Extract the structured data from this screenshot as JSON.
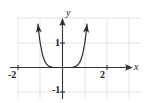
{
  "figure": {
    "title": "",
    "axis_labels": {
      "x": "x",
      "y": "y"
    },
    "tick_labels": {
      "x_neg2": "-2",
      "x_2": "2",
      "y_1": "1",
      "y_neg1": "-1"
    },
    "colors": {
      "curve": "#262626",
      "axis": "#333333",
      "grid": "#d9d9d9",
      "text": "#1a1a1a",
      "background": "#ffffff"
    }
  },
  "chart_data": {
    "type": "line",
    "title": "",
    "xlabel": "x",
    "ylabel": "y",
    "xlim": [
      -2.6,
      3.1
    ],
    "ylim": [
      -1.35,
      2.5
    ],
    "xticks": [
      -2,
      2
    ],
    "xticklabels": [
      "-2",
      "2"
    ],
    "yticks": [
      1,
      -1
    ],
    "yticklabels": [
      "1",
      "-1"
    ],
    "grid": true,
    "grid_x": [
      -2,
      -1,
      0,
      1,
      2,
      3
    ],
    "grid_y": [
      -1,
      0,
      1,
      2
    ],
    "legend": null,
    "annotations": [],
    "series": [
      {
        "name": "y = x^6",
        "equation": "y = x^6",
        "color": "#262626",
        "arrow_start": true,
        "arrow_end": true,
        "x": [
          -1.55,
          -1.5,
          -1.45,
          -1.4,
          -1.35,
          -1.3,
          -1.25,
          -1.2,
          -1.15,
          -1.1,
          -1.05,
          -1.0,
          -0.9,
          -0.8,
          -0.7,
          -0.6,
          -0.5,
          -0.4,
          -0.3,
          -0.2,
          -0.1,
          0.0,
          0.1,
          0.2,
          0.3,
          0.4,
          0.5,
          0.6,
          0.7,
          0.8,
          0.9,
          1.0,
          1.05,
          1.1,
          1.15,
          1.2,
          1.25,
          1.3,
          1.35,
          1.4,
          1.45,
          1.5,
          1.55
        ],
        "y": [
          13.84,
          11.39,
          9.29,
          7.53,
          6.05,
          4.83,
          3.81,
          2.99,
          2.31,
          1.77,
          1.34,
          1.0,
          0.53,
          0.26,
          0.12,
          0.047,
          0.016,
          0.0041,
          0.00073,
          6.4e-05,
          1e-06,
          0.0,
          1e-06,
          6.4e-05,
          0.00073,
          0.0041,
          0.016,
          0.047,
          0.12,
          0.26,
          0.53,
          1.0,
          1.34,
          1.77,
          2.31,
          2.99,
          3.81,
          4.83,
          6.05,
          7.53,
          9.29,
          11.39,
          13.84
        ]
      }
    ]
  }
}
